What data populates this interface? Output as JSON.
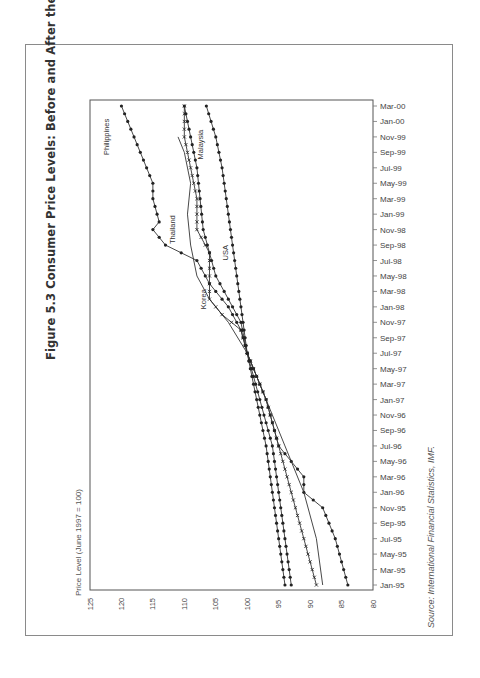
{
  "figure": {
    "title": "Figure 5.3 Consumer Price Levels: Before and After the Crisis (Crisis Countries)",
    "source": "Source: International Financial Statistics, IMF."
  },
  "chart_data": {
    "type": "line",
    "orientation": "rotated 90° counter-clockwise (time axis vertical on right, value axis along bottom)",
    "title": "Figure 5.3 Consumer Price Levels: Before and After the Crisis (Crisis Countries)",
    "ylabel": "Price Level (June 1997 = 100)",
    "xlabel": "",
    "ylim": [
      80,
      125
    ],
    "yticks": [
      125,
      120,
      115,
      110,
      105,
      100,
      95,
      90,
      85,
      80
    ],
    "x_tick_labels": [
      "Jan-95",
      "Mar-95",
      "May-95",
      "Jul-95",
      "Sep-95",
      "Nov-95",
      "Jan-96",
      "Mar-96",
      "May-96",
      "Jul-96",
      "Sep-96",
      "Nov-96",
      "Jan-97",
      "Mar-97",
      "May-97",
      "Jul-97",
      "Sep-97",
      "Nov-97",
      "Jan-98",
      "Mar-98",
      "May-98",
      "Jul-98",
      "Sep-98",
      "Nov-98",
      "Jan-99",
      "Mar-99",
      "May-99",
      "Jul-99",
      "Sep-99",
      "Nov-99",
      "Jan-00",
      "Mar-00"
    ],
    "x_note": "x values are month index from Jan-95 (0) to Mar-00 (62)",
    "grid": false,
    "legend": "inline labels",
    "series": [
      {
        "name": "Philippines",
        "marker": "dot",
        "x": [
          0,
          6,
          10,
          12,
          14,
          18,
          24,
          30,
          33,
          36,
          39,
          42,
          44,
          46,
          47,
          50,
          52,
          54,
          56,
          58,
          60,
          62
        ],
        "values": [
          84,
          86,
          88,
          91,
          91,
          95,
          97,
          100,
          101,
          103,
          106,
          108,
          113,
          115,
          114,
          115,
          115,
          116,
          117,
          118,
          119,
          120
        ]
      },
      {
        "name": "Thailand",
        "marker": "none",
        "x": [
          0,
          6,
          12,
          18,
          24,
          30,
          34,
          37,
          40,
          44,
          48,
          52,
          56,
          58
        ],
        "values": [
          88,
          89,
          91,
          94,
          97,
          100,
          103,
          106,
          108,
          109,
          109.5,
          109,
          110,
          111
        ]
      },
      {
        "name": "Korea",
        "marker": "cross",
        "x": [
          0,
          6,
          12,
          18,
          24,
          30,
          33,
          35,
          37,
          40,
          43,
          46,
          50,
          54,
          58,
          62
        ],
        "values": [
          89,
          91,
          93,
          95,
          97,
          100,
          101,
          104,
          106,
          106,
          106,
          108,
          108,
          109,
          110,
          110
        ]
      },
      {
        "name": "Malaysia",
        "marker": "dot",
        "x": [
          0,
          6,
          12,
          18,
          24,
          30,
          34,
          37,
          40,
          43,
          46,
          50,
          54,
          58,
          62
        ],
        "values": [
          93,
          94,
          95,
          96,
          98,
          100,
          101,
          103,
          105,
          106,
          107,
          107.5,
          108,
          109,
          110
        ]
      },
      {
        "name": "USA",
        "marker": "dot",
        "x": [
          0,
          6,
          12,
          18,
          24,
          30,
          36,
          42,
          48,
          54,
          58,
          62
        ],
        "values": [
          94,
          95,
          96,
          97,
          98.5,
          100,
          101,
          102,
          103,
          104,
          105,
          106.5
        ]
      }
    ],
    "labels": [
      {
        "text": "Philippines",
        "value": 122,
        "month": 58
      },
      {
        "text": "Thailand",
        "value": 111.5,
        "month": 46
      },
      {
        "text": "Malaysia",
        "value": 107,
        "month": 57
      },
      {
        "text": "Korea",
        "value": 106.5,
        "month": 37
      },
      {
        "text": "USA",
        "value": 103,
        "month": 43
      }
    ]
  }
}
